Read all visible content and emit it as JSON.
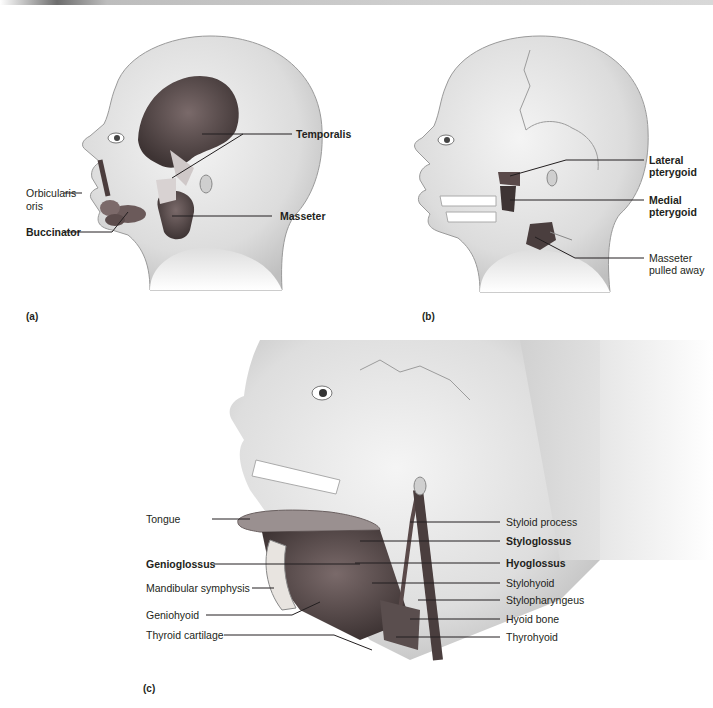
{
  "figure": {
    "panels": [
      {
        "id": "a",
        "tag": "(a)",
        "labels": [
          {
            "text": "Temporalis",
            "bold": true
          },
          {
            "text": "Orbicularis oris",
            "line1": "Orbicularis",
            "line2": "oris",
            "bold": false
          },
          {
            "text": "Masseter",
            "bold": true
          },
          {
            "text": "Buccinator",
            "bold": true
          }
        ]
      },
      {
        "id": "b",
        "tag": "(b)",
        "labels": [
          {
            "text": "Lateral pterygoid",
            "line1": "Lateral",
            "line2": "pterygoid",
            "bold": true
          },
          {
            "text": "Medial pterygoid",
            "line1": "Medial",
            "line2": "pterygoid",
            "bold": true
          },
          {
            "text": "Masseter pulled away",
            "line1": "Masseter",
            "line2": "pulled away",
            "bold": false
          }
        ]
      },
      {
        "id": "c",
        "tag": "(c)",
        "left_labels": [
          {
            "text": "Tongue",
            "bold": false
          },
          {
            "text": "Genioglossus",
            "bold": true
          },
          {
            "text": "Mandibular symphysis",
            "bold": false
          },
          {
            "text": "Geniohyoid",
            "bold": false
          },
          {
            "text": "Thyroid cartilage",
            "bold": false
          }
        ],
        "right_labels": [
          {
            "text": "Styloid process",
            "bold": false
          },
          {
            "text": "Styloglossus",
            "bold": true
          },
          {
            "text": "Hyoglossus",
            "bold": true
          },
          {
            "text": "Stylohyoid",
            "bold": false
          },
          {
            "text": "Stylopharyngeus",
            "bold": false
          },
          {
            "text": "Hyoid bone",
            "bold": false
          },
          {
            "text": "Thyrohyoid",
            "bold": false
          }
        ]
      }
    ],
    "colors": {
      "skin": "#e6e6e6",
      "skin_shade": "#bdbdbd",
      "muscle": "#5a4a4a",
      "muscle_dark": "#3b3030",
      "bone": "#f0f0f0",
      "leader": "#231f20"
    }
  }
}
